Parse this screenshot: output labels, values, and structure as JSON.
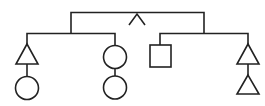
{
  "diagram": {
    "type": "tree",
    "colors": {
      "stroke": "#222222",
      "background": "#ffffff"
    },
    "root": {
      "symbol": "caret",
      "glyph": "^"
    },
    "branches": [
      {
        "name": "left",
        "children": [
          {
            "name": "left-left",
            "shapes": [
              "triangle",
              "circle"
            ]
          },
          {
            "name": "left-right",
            "shapes": [
              "circle",
              "circle"
            ]
          }
        ]
      },
      {
        "name": "right",
        "children": [
          {
            "name": "right-left",
            "shapes": [
              "square"
            ]
          },
          {
            "name": "right-right",
            "shapes": [
              "triangle",
              "triangle"
            ]
          }
        ]
      }
    ]
  }
}
